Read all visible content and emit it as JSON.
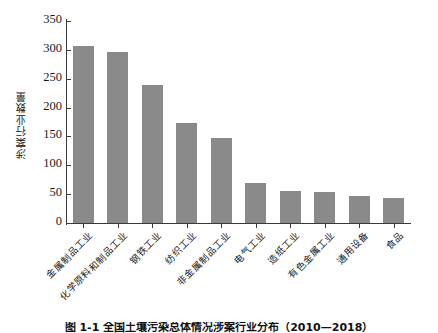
{
  "chart_data": {
    "type": "bar",
    "title": "",
    "xlabel": "",
    "ylabel": "涉案行业数量",
    "ylim": [
      0,
      350
    ],
    "yticks": [
      0,
      50,
      100,
      150,
      200,
      250,
      300,
      350
    ],
    "grid": false,
    "legend": null,
    "bar_color": "#8a8a8a",
    "axis_color": "#3a3a3a",
    "categories": [
      "金属制品工业",
      "化学原料和制品工业",
      "钢铁工业",
      "纺织工业",
      "非金属制品工业",
      "电气工业",
      "造纸工业",
      "有色金属工业",
      "通用设备",
      "食品"
    ],
    "values": [
      306,
      296,
      240,
      174,
      148,
      70,
      55,
      53,
      47,
      44
    ]
  },
  "figure": {
    "caption": "图 1-1  全国土壤污染总体情况涉案行业分布（2010—2018）"
  }
}
